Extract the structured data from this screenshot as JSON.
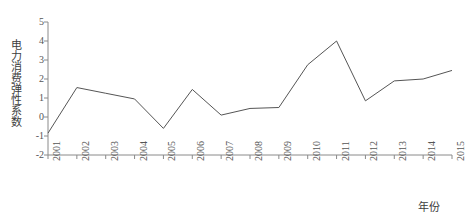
{
  "chart_data": {
    "type": "line",
    "title": "",
    "xlabel": "年份",
    "ylabel": "电力消费弹性系数",
    "categories": [
      "2001",
      "2002",
      "2003",
      "2004",
      "2005",
      "2006",
      "2007",
      "2008",
      "2009",
      "2010",
      "2011",
      "2012",
      "2013",
      "2014",
      "2015"
    ],
    "values": [
      -0.85,
      1.55,
      1.25,
      0.95,
      -0.6,
      1.45,
      0.1,
      0.45,
      0.5,
      2.75,
      4.0,
      0.85,
      1.9,
      2.0,
      2.45
    ],
    "series": [
      {
        "name": "电力消费弹性系数",
        "values": [
          -0.85,
          1.55,
          1.25,
          0.95,
          -0.6,
          1.45,
          0.1,
          0.45,
          0.5,
          2.75,
          4.0,
          0.85,
          1.9,
          2.0,
          2.45
        ]
      }
    ],
    "ylim": [
      -2,
      5
    ],
    "y_ticks": [
      "5",
      "4",
      "3",
      "2",
      "1",
      "0",
      "-1",
      "-2"
    ],
    "y_tick_values": [
      5,
      4,
      3,
      2,
      1,
      0,
      -1,
      -2
    ],
    "x_tick_labels": [
      "2001",
      "2002",
      "2003",
      "2004",
      "2005",
      "2006",
      "2007",
      "2008",
      "2009",
      "2010",
      "2011",
      "2012",
      "2013",
      "2014",
      "2015"
    ],
    "grid": false,
    "legend": "none",
    "line_color": "#555555",
    "axis_color": "#8a8a8a",
    "background_color": "#ffffff"
  },
  "axes": {
    "y_title": "电力消费弹性系数",
    "x_title": "年份"
  }
}
